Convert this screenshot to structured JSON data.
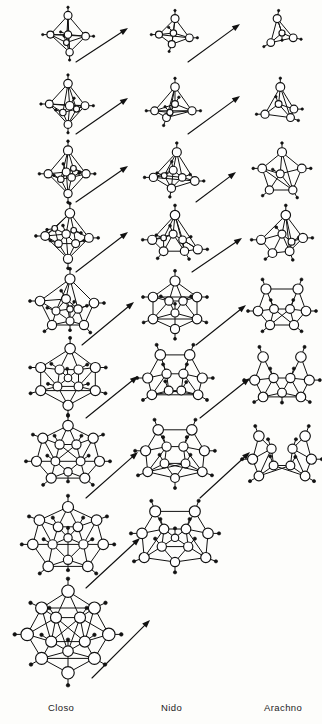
{
  "figure": {
    "width": 322,
    "height": 724,
    "background": "#fdfdfb",
    "ink": "#111111"
  },
  "columns": [
    {
      "key": "closo",
      "label": "Closo",
      "x": 68,
      "label_x": 48,
      "label_y": 702
    },
    {
      "key": "nido",
      "label": "Nido",
      "x": 175,
      "label_x": 161,
      "label_y": 702
    },
    {
      "key": "arachno",
      "label": "Arachno",
      "x": 282,
      "label_x": 264,
      "label_y": 702
    }
  ],
  "label_row": {
    "y": 702,
    "font_size_px": 9.5
  },
  "rows": [
    {
      "index": 1,
      "center_y": 33,
      "cells": {
        "closo": {
          "name": "octahedron",
          "vertices": 6,
          "scale": 0.8,
          "shape": "octahedron"
        },
        "nido": {
          "name": "square-pyramid",
          "vertices": 5,
          "scale": 0.8,
          "shape": "square_pyramid"
        },
        "arachno": {
          "name": "butterfly-tetrahedron",
          "vertices": 4,
          "scale": 0.8,
          "shape": "arachno4"
        }
      },
      "arrows": [
        {
          "from": "closo",
          "to": "nido",
          "x1": 76,
          "y1": 62,
          "x2": 128,
          "y2": 28
        },
        {
          "from": "nido",
          "to": "arachno",
          "x1": 188,
          "y1": 62,
          "x2": 240,
          "y2": 24
        }
      ]
    },
    {
      "index": 2,
      "center_y": 104,
      "cells": {
        "closo": {
          "name": "pentagonal-bipyramid",
          "vertices": 7,
          "scale": 0.85,
          "shape": "pent_bipyramid"
        },
        "nido": {
          "name": "nido-hexaborane",
          "vertices": 6,
          "scale": 0.85,
          "shape": "nido6"
        },
        "arachno": {
          "name": "arachno-pentaborane",
          "vertices": 5,
          "scale": 0.85,
          "shape": "arachno5"
        }
      },
      "arrows": [
        {
          "from": "closo",
          "to": "nido",
          "x1": 76,
          "y1": 134,
          "x2": 128,
          "y2": 98
        },
        {
          "from": "nido",
          "to": "arachno",
          "x1": 188,
          "y1": 134,
          "x2": 240,
          "y2": 96
        }
      ]
    },
    {
      "index": 3,
      "center_y": 172,
      "cells": {
        "closo": {
          "name": "dodecahedron-d2d",
          "vertices": 8,
          "scale": 0.9,
          "shape": "closo8"
        },
        "nido": {
          "name": "nido-heptaborane",
          "vertices": 7,
          "scale": 0.9,
          "shape": "nido7"
        },
        "arachno": {
          "name": "arachno-hexaborane",
          "vertices": 6,
          "scale": 0.9,
          "shape": "arachno6"
        }
      },
      "arrows": [
        {
          "from": "closo",
          "to": "nido",
          "x1": 76,
          "y1": 202,
          "x2": 128,
          "y2": 166
        },
        {
          "from": "nido",
          "to": "arachno",
          "x1": 196,
          "y1": 202,
          "x2": 236,
          "y2": 172
        }
      ]
    },
    {
      "index": 4,
      "center_y": 236,
      "cells": {
        "closo": {
          "name": "tricapped-trigonal-prism",
          "vertices": 9,
          "scale": 0.95,
          "shape": "closo9"
        },
        "nido": {
          "name": "nido-octaborane",
          "vertices": 8,
          "scale": 0.95,
          "shape": "nido8"
        },
        "arachno": {
          "name": "arachno-heptaborane",
          "vertices": 7,
          "scale": 0.95,
          "shape": "arachno7"
        }
      },
      "arrows": [
        {
          "from": "closo",
          "to": "nido",
          "x1": 76,
          "y1": 272,
          "x2": 128,
          "y2": 232
        },
        {
          "from": "nido",
          "to": "arachno",
          "x1": 192,
          "y1": 272,
          "x2": 242,
          "y2": 238
        }
      ]
    },
    {
      "index": 5,
      "center_y": 305,
      "cells": {
        "closo": {
          "name": "bicapped-square-antiprism",
          "vertices": 10,
          "scale": 1.0,
          "shape": "closo10"
        },
        "nido": {
          "name": "nido-nonaborane",
          "vertices": 9,
          "scale": 1.0,
          "shape": "nido9"
        },
        "arachno": {
          "name": "arachno-octaborane",
          "vertices": 8,
          "scale": 1.0,
          "shape": "arachno8"
        }
      },
      "arrows": [
        {
          "from": "closo",
          "to": "nido",
          "x1": 82,
          "y1": 345,
          "x2": 134,
          "y2": 302
        },
        {
          "from": "nido",
          "to": "arachno",
          "x1": 196,
          "y1": 345,
          "x2": 246,
          "y2": 305
        }
      ]
    },
    {
      "index": 6,
      "center_y": 378,
      "cells": {
        "closo": {
          "name": "octadecahedron",
          "vertices": 11,
          "scale": 1.05,
          "shape": "closo11"
        },
        "nido": {
          "name": "nido-decaborane",
          "vertices": 10,
          "scale": 1.05,
          "shape": "nido10"
        },
        "arachno": {
          "name": "arachno-nonaborane",
          "vertices": 9,
          "scale": 1.05,
          "shape": "arachno9"
        }
      },
      "arrows": [
        {
          "from": "closo",
          "to": "nido",
          "x1": 86,
          "y1": 418,
          "x2": 138,
          "y2": 376
        },
        {
          "from": "nido",
          "to": "arachno",
          "x1": 200,
          "y1": 418,
          "x2": 250,
          "y2": 378
        }
      ]
    },
    {
      "index": 7,
      "center_y": 455,
      "cells": {
        "closo": {
          "name": "closo-dodecaborane-12v",
          "vertices": 12,
          "scale": 1.05,
          "shape": "closo12"
        },
        "nido": {
          "name": "nido-undecaborane",
          "vertices": 11,
          "scale": 1.05,
          "shape": "nido11"
        },
        "arachno": {
          "name": "arachno-decaborane",
          "vertices": 10,
          "scale": 1.05,
          "shape": "arachno10"
        }
      },
      "arrows": [
        {
          "from": "closo",
          "to": "nido",
          "x1": 86,
          "y1": 498,
          "x2": 138,
          "y2": 452
        },
        {
          "from": "nido",
          "to": "arachno",
          "x1": 200,
          "y1": 498,
          "x2": 250,
          "y2": 452
        }
      ]
    },
    {
      "index": 8,
      "center_y": 540,
      "cells": {
        "closo": {
          "name": "closo-tridecaborane",
          "vertices": 13,
          "scale": 1.1,
          "shape": "closo13"
        },
        "nido": {
          "name": "nido-dodecaborane",
          "vertices": 12,
          "scale": 1.1,
          "shape": "nido12"
        },
        "arachno": null
      },
      "arrows": [
        {
          "from": "closo",
          "to": "nido",
          "x1": 86,
          "y1": 588,
          "x2": 140,
          "y2": 538
        }
      ]
    },
    {
      "index": 9,
      "center_y": 632,
      "cells": {
        "closo": {
          "name": "icosahedron",
          "vertices": 12,
          "scale": 1.2,
          "shape": "icosahedron"
        },
        "nido": null,
        "arachno": null
      },
      "arrows": [
        {
          "from": "closo",
          "to": "nido",
          "x1": 92,
          "y1": 678,
          "x2": 150,
          "y2": 620
        }
      ]
    }
  ],
  "legend": {
    "vertex_note": "open circle = boron vertex",
    "terminal_note": "filled dot = terminal hydrogen"
  }
}
